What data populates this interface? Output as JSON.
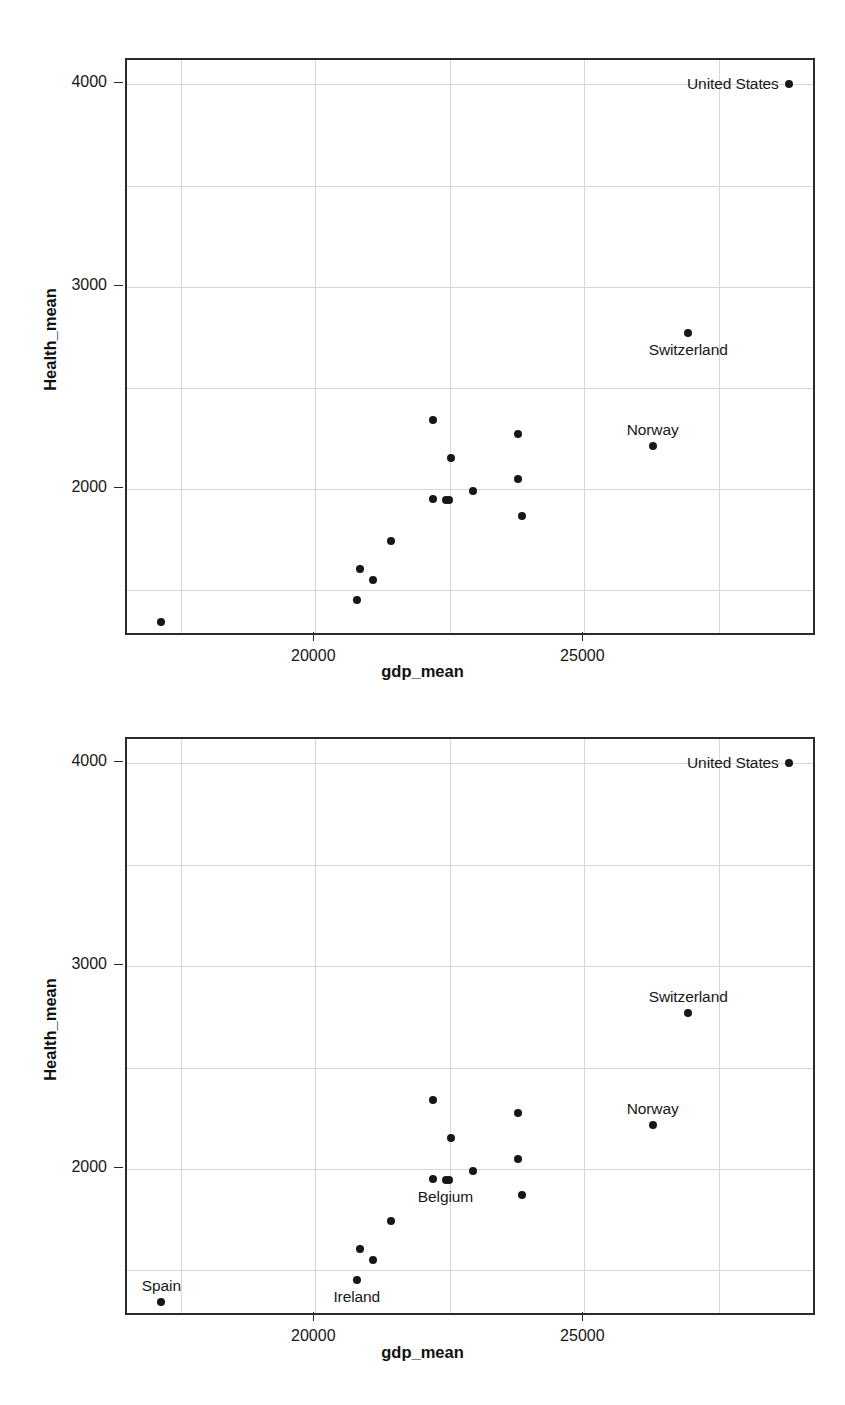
{
  "figure": {
    "kind": "two stacked scatter plots",
    "panels": [
      "panel-1",
      "panel-2"
    ]
  },
  "axis": {
    "xlabel": "gdp_mean",
    "ylabel": "Health_mean",
    "xticks": [
      "20000",
      "25000"
    ],
    "yticks": [
      "4000",
      "3000",
      "2000"
    ],
    "grid_color": "#d6d6d6",
    "frame_color": "#2b2b2b",
    "point_color": "#171717"
  },
  "chart_data": [
    {
      "type": "scatter",
      "title": "",
      "xlabel": "gdp_mean",
      "ylabel": "Health_mean",
      "xlim": [
        16500,
        29250
      ],
      "ylim": [
        1290,
        4120
      ],
      "xticks": [
        20000,
        25000
      ],
      "yticks": [
        4000,
        3000,
        2000
      ],
      "xgrid": [
        17500,
        20000,
        22500,
        25000,
        27500
      ],
      "ygrid": [
        1500,
        2000,
        2500,
        3000,
        3500,
        4000
      ],
      "grid": true,
      "legend": "none",
      "points": [
        {
          "label": "United States",
          "x": 28800,
          "y": 4000,
          "label_pos": "left"
        },
        {
          "label": "Switzerland",
          "x": 26930,
          "y": 2770,
          "label_pos": "below"
        },
        {
          "label": "Norway",
          "x": 26270,
          "y": 2215,
          "label_pos": "above"
        },
        {
          "label": "",
          "x": 22190,
          "y": 2340,
          "label_pos": "none"
        },
        {
          "label": "",
          "x": 23770,
          "y": 2275,
          "label_pos": "none"
        },
        {
          "label": "",
          "x": 22530,
          "y": 2155,
          "label_pos": "none"
        },
        {
          "label": "",
          "x": 23760,
          "y": 2050,
          "label_pos": "none"
        },
        {
          "label": "",
          "x": 22940,
          "y": 1990,
          "label_pos": "none"
        },
        {
          "label": "",
          "x": 22190,
          "y": 1950,
          "label_pos": "none"
        },
        {
          "label": "Belgium",
          "x": 22420,
          "y": 1945,
          "label_pos": "below"
        },
        {
          "label": "",
          "x": 22480,
          "y": 1945,
          "label_pos": "none"
        },
        {
          "label": "",
          "x": 23850,
          "y": 1870,
          "label_pos": "none"
        },
        {
          "label": "",
          "x": 21400,
          "y": 1745,
          "label_pos": "none"
        },
        {
          "label": "",
          "x": 20830,
          "y": 1605,
          "label_pos": "none"
        },
        {
          "label": "",
          "x": 21080,
          "y": 1550,
          "label_pos": "none"
        },
        {
          "label": "Ireland",
          "x": 20770,
          "y": 1455,
          "label_pos": "below"
        },
        {
          "label": "Spain",
          "x": 17140,
          "y": 1345,
          "label_pos": "above"
        }
      ],
      "labeled_in_panel_1": [
        "United States",
        "Switzerland",
        "Norway"
      ],
      "labeled_in_panel_2": [
        "United States",
        "Switzerland",
        "Norway",
        "Belgium",
        "Ireland",
        "Spain"
      ]
    }
  ]
}
